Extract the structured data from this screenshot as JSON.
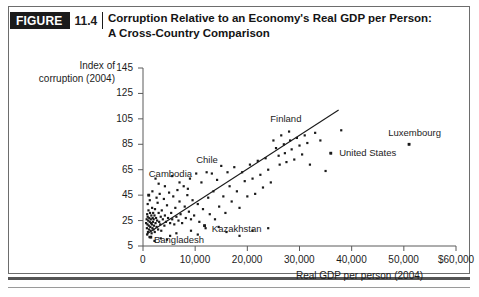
{
  "figure": {
    "badge_word": "FIGURE",
    "badge_number": "11.4",
    "title_line1": "Corruption Relative to an Economy's Real GDP per Person:",
    "title_line2": "A Cross-Country Comparison"
  },
  "colors": {
    "ink": "#1c1c1c",
    "badge_bg": "#1b1b1b",
    "frame": "#6d6d6d",
    "point": "#1a1a1a",
    "trendline": "#1a1a1a"
  },
  "chart_data": {
    "type": "scatter",
    "title": "Corruption Relative to an Economy's Real GDP per Person: A Cross-Country Comparison",
    "xlabel": "Real GDP per person (2004)",
    "ylabel": "Index of corruption (2004)",
    "ylabel_line1": "Index of",
    "ylabel_line2": "corruption (2004)",
    "xlim": [
      0,
      60000
    ],
    "ylim": [
      5,
      145
    ],
    "grid": false,
    "legend": "none",
    "xticks": [
      0,
      10000,
      20000,
      30000,
      40000,
      50000,
      60000
    ],
    "xtick_labels": [
      "0",
      "10,000",
      "20,000",
      "30,000",
      "40,000",
      "50,000",
      "$60,000"
    ],
    "yticks": [
      5,
      25,
      45,
      65,
      85,
      105,
      125,
      145
    ],
    "ytick_labels": [
      "5",
      "25",
      "45",
      "65",
      "85",
      "105",
      "125",
      "145"
    ],
    "trendline": {
      "x0": 600,
      "y0": 14,
      "x1": 37500,
      "y1": 112
    },
    "annotations": [
      {
        "label": "Cambodia",
        "text_x": 1100,
        "text_y": 62,
        "point_x": 1100,
        "point_y": 45
      },
      {
        "label": "Bangladesh",
        "text_x": 2100,
        "text_y": 10,
        "point_x": 1500,
        "point_y": 12
      },
      {
        "label": "Kazakhstan",
        "text_x": 13200,
        "text_y": 18,
        "point_x": 11800,
        "point_y": 21
      },
      {
        "label": "Chile",
        "text_x": 10200,
        "text_y": 73,
        "point_x": null,
        "point_y": null
      },
      {
        "label": "Finland",
        "text_x": 24400,
        "text_y": 105,
        "point_x": null,
        "point_y": null
      },
      {
        "label": "United States",
        "text_x": 37600,
        "text_y": 78,
        "point_x": 36000,
        "point_y": 78
      },
      {
        "label": "Luxembourg",
        "text_x": 47000,
        "text_y": 94,
        "point_x": 51000,
        "point_y": 85
      }
    ],
    "points": [
      [
        600,
        23
      ],
      [
        700,
        26
      ],
      [
        750,
        19
      ],
      [
        800,
        30
      ],
      [
        820,
        14
      ],
      [
        850,
        22
      ],
      [
        900,
        28
      ],
      [
        950,
        16
      ],
      [
        1000,
        25
      ],
      [
        1050,
        33
      ],
      [
        1100,
        21
      ],
      [
        1100,
        45
      ],
      [
        1150,
        18
      ],
      [
        1200,
        27
      ],
      [
        1250,
        12
      ],
      [
        1300,
        24
      ],
      [
        1350,
        31
      ],
      [
        1400,
        20
      ],
      [
        1450,
        17
      ],
      [
        1500,
        12
      ],
      [
        1500,
        26
      ],
      [
        1550,
        23
      ],
      [
        1600,
        29
      ],
      [
        1650,
        15
      ],
      [
        1700,
        22
      ],
      [
        1750,
        35
      ],
      [
        1800,
        19
      ],
      [
        1850,
        27
      ],
      [
        1900,
        24
      ],
      [
        1950,
        31
      ],
      [
        2000,
        18
      ],
      [
        2050,
        26
      ],
      [
        2100,
        21
      ],
      [
        2200,
        29
      ],
      [
        2250,
        16
      ],
      [
        2300,
        34
      ],
      [
        2400,
        23
      ],
      [
        2500,
        27
      ],
      [
        2600,
        20
      ],
      [
        2700,
        25
      ],
      [
        2800,
        39
      ],
      [
        2900,
        18
      ],
      [
        3000,
        31
      ],
      [
        3100,
        24
      ],
      [
        3200,
        46
      ],
      [
        3300,
        22
      ],
      [
        3400,
        28
      ],
      [
        3500,
        17
      ],
      [
        3600,
        33
      ],
      [
        3800,
        26
      ],
      [
        4000,
        42
      ],
      [
        4100,
        21
      ],
      [
        4200,
        29
      ],
      [
        4400,
        24
      ],
      [
        4600,
        37
      ],
      [
        4800,
        27
      ],
      [
        5000,
        47
      ],
      [
        5200,
        23
      ],
      [
        5400,
        31
      ],
      [
        5600,
        26
      ],
      [
        5800,
        44
      ],
      [
        6000,
        22
      ],
      [
        6200,
        35
      ],
      [
        6400,
        28
      ],
      [
        6600,
        49
      ],
      [
        6800,
        25
      ],
      [
        7000,
        40
      ],
      [
        7200,
        30
      ],
      [
        7500,
        23
      ],
      [
        7800,
        52
      ],
      [
        8000,
        36
      ],
      [
        8200,
        27
      ],
      [
        8500,
        45
      ],
      [
        8800,
        32
      ],
      [
        9000,
        58
      ],
      [
        9200,
        26
      ],
      [
        9500,
        41
      ],
      [
        9800,
        29
      ],
      [
        10200,
        62
      ],
      [
        10500,
        38
      ],
      [
        10800,
        24
      ],
      [
        11200,
        55
      ],
      [
        11500,
        34
      ],
      [
        11800,
        21
      ],
      [
        12200,
        63
      ],
      [
        12500,
        43
      ],
      [
        12800,
        30
      ],
      [
        13200,
        62
      ],
      [
        13500,
        48
      ],
      [
        13800,
        26
      ],
      [
        14200,
        57
      ],
      [
        14600,
        36
      ],
      [
        15000,
        68
      ],
      [
        15400,
        44
      ],
      [
        15800,
        31
      ],
      [
        16200,
        63
      ],
      [
        16600,
        52
      ],
      [
        17000,
        40
      ],
      [
        17500,
        67
      ],
      [
        18000,
        48
      ],
      [
        18500,
        35
      ],
      [
        19000,
        63
      ],
      [
        19500,
        56
      ],
      [
        20000,
        44
      ],
      [
        20500,
        69
      ],
      [
        21000,
        58
      ],
      [
        21500,
        46
      ],
      [
        22000,
        72
      ],
      [
        22500,
        61
      ],
      [
        23000,
        51
      ],
      [
        23500,
        74
      ],
      [
        24000,
        65
      ],
      [
        24500,
        55
      ],
      [
        25000,
        88
      ],
      [
        25500,
        82
      ],
      [
        26000,
        76
      ],
      [
        26200,
        69
      ],
      [
        26500,
        92
      ],
      [
        27000,
        85
      ],
      [
        27200,
        78
      ],
      [
        27500,
        71
      ],
      [
        28000,
        95
      ],
      [
        28200,
        88
      ],
      [
        28500,
        81
      ],
      [
        29000,
        73
      ],
      [
        29500,
        90
      ],
      [
        30000,
        84
      ],
      [
        30500,
        77
      ],
      [
        31000,
        92
      ],
      [
        31500,
        86
      ],
      [
        32000,
        69
      ],
      [
        33000,
        94
      ],
      [
        34000,
        88
      ],
      [
        35000,
        64
      ],
      [
        36000,
        78
      ],
      [
        38000,
        96
      ],
      [
        51000,
        85
      ],
      [
        2400,
        58
      ],
      [
        3000,
        54
      ],
      [
        4200,
        52
      ],
      [
        5600,
        60
      ],
      [
        7000,
        55
      ],
      [
        8600,
        50
      ],
      [
        1800,
        48
      ],
      [
        2600,
        43
      ],
      [
        900,
        38
      ],
      [
        1300,
        41
      ],
      [
        6400,
        15
      ],
      [
        9200,
        17
      ],
      [
        10500,
        14
      ],
      [
        12000,
        19
      ],
      [
        14500,
        20
      ],
      [
        16000,
        16
      ],
      [
        5200,
        13
      ],
      [
        3400,
        11
      ],
      [
        2200,
        9
      ],
      [
        4600,
        10
      ],
      [
        18500,
        13
      ],
      [
        21000,
        17
      ],
      [
        24000,
        19
      ]
    ]
  }
}
